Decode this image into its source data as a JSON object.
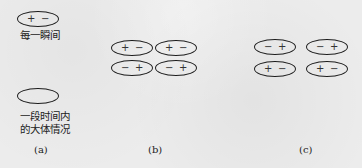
{
  "panels": {
    "a": {
      "label": "(a)",
      "instant": {
        "dipole": {
          "left": "+",
          "right": "−"
        },
        "caption": "每一瞬间"
      },
      "average": {
        "dipole": {
          "left": "",
          "right": ""
        },
        "caption_line1": "一段时间内",
        "caption_line2": "的大体情况"
      }
    },
    "b": {
      "label": "(b)",
      "dipoles": [
        {
          "left": "+",
          "right": "−"
        },
        {
          "left": "+",
          "right": "−"
        },
        {
          "left": "−",
          "right": "+"
        },
        {
          "left": "−",
          "right": "+"
        }
      ]
    },
    "c": {
      "label": "(c)",
      "dipoles": [
        {
          "left": "−",
          "right": "+"
        },
        {
          "left": "−",
          "right": "+"
        },
        {
          "left": "+",
          "right": "−"
        },
        {
          "left": "+",
          "right": "−"
        }
      ]
    }
  }
}
